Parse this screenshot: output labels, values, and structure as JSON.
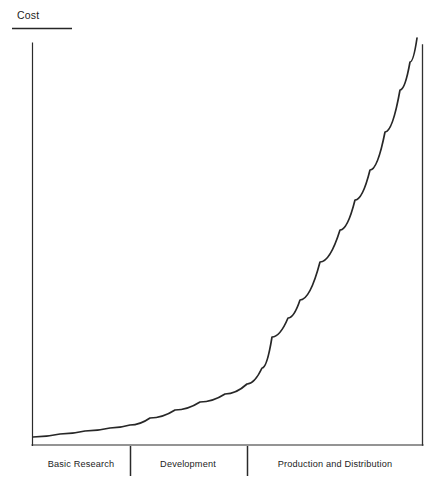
{
  "chart_data": {
    "type": "line",
    "title": "",
    "ylabel": "Cost",
    "xlabel": "",
    "grid": false,
    "legend": null,
    "axis": {
      "x_range_px": [
        32,
        423
      ],
      "y_range_px": [
        445,
        38
      ],
      "y_axis_label": "Cost",
      "x_tick_labels": [
        "Basic Research",
        "Development",
        "Production and Distribution"
      ],
      "x_tick_boundaries_px": [
        32,
        130,
        247,
        423
      ]
    },
    "series": [
      {
        "name": "Cost",
        "description": "Cumulative cost rising exponentially across project phases",
        "x": [
          0,
          5,
          10,
          15,
          20,
          25,
          30,
          35,
          40,
          45,
          50,
          55,
          60,
          65,
          70,
          75,
          80,
          85,
          90,
          95,
          98
        ],
        "y": [
          2,
          3,
          4,
          6,
          8,
          10,
          13,
          16,
          20,
          24,
          29,
          34,
          40,
          46,
          53,
          60,
          68,
          76,
          85,
          94,
          100
        ],
        "points_px": [
          [
            33,
            437
          ],
          [
            60,
            434
          ],
          [
            85,
            431
          ],
          [
            110,
            428
          ],
          [
            130,
            425
          ],
          [
            150,
            418
          ],
          [
            175,
            410
          ],
          [
            200,
            402
          ],
          [
            225,
            394
          ],
          [
            247,
            384
          ],
          [
            262,
            368
          ],
          [
            272,
            337
          ],
          [
            288,
            318
          ],
          [
            300,
            300
          ],
          [
            320,
            262
          ],
          [
            340,
            230
          ],
          [
            355,
            200
          ],
          [
            370,
            170
          ],
          [
            385,
            132
          ],
          [
            400,
            90
          ],
          [
            410,
            62
          ],
          [
            417,
            38
          ]
        ]
      }
    ],
    "annotations": {
      "cost_underline": true,
      "right_vertical_boundary": true
    }
  },
  "labels": {
    "y_axis": "Cost",
    "phases": [
      {
        "id": "basic-research",
        "text": "Basic Research",
        "center_px": 81
      },
      {
        "id": "development",
        "text": "Development",
        "center_px": 188
      },
      {
        "id": "production-distribution",
        "text": "Production and Distribution",
        "center_px": 335
      }
    ]
  },
  "colors": {
    "background": "#ffffff",
    "ink": "#272727",
    "axis": "#2b2b2b"
  }
}
